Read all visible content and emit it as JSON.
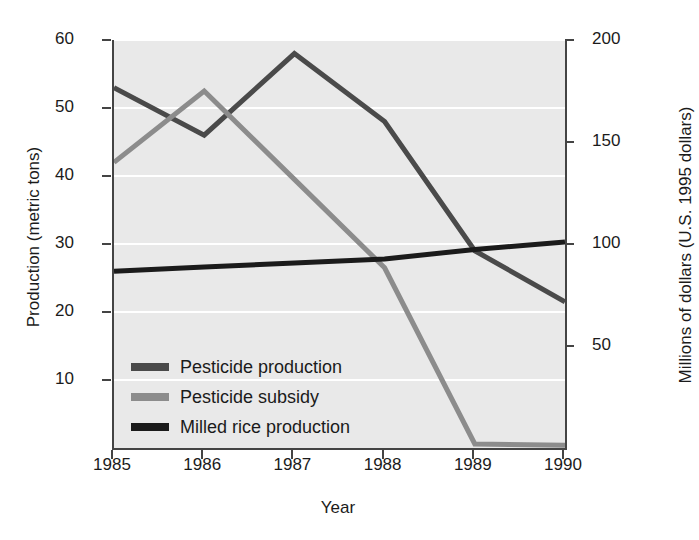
{
  "chart_data": {
    "type": "line",
    "title": "",
    "xlabel": "Year",
    "ylabel": "Production (metric tons)",
    "ylabel_right": "Millions of dollars (U.S. 1995 dollars)",
    "x": [
      1985,
      1986,
      1987,
      1988,
      1989,
      1990
    ],
    "categories": [
      "1985",
      "1986",
      "1987",
      "1988",
      "1989",
      "1990"
    ],
    "xlim": [
      1985,
      1990
    ],
    "ylim_left": [
      0,
      60
    ],
    "ylim_right": [
      0,
      200
    ],
    "yticks_left": [
      10,
      20,
      30,
      40,
      50,
      60
    ],
    "yticks_left_labels": [
      "10",
      "20",
      "30",
      "40",
      "50",
      "60"
    ],
    "yticks_right": [
      50,
      100,
      150,
      200
    ],
    "yticks_right_labels": [
      "50",
      "100",
      "150",
      "200"
    ],
    "grid": true,
    "grid_color": "#ffffff",
    "legend_position": "lower-left-inside",
    "plot_background": "#e9e9e9",
    "series": [
      {
        "name": "Pesticide production",
        "axis": "left",
        "color": "#4a4a4a",
        "values": [
          53.0,
          46.0,
          58.0,
          48.0,
          29.0,
          21.5
        ]
      },
      {
        "name": "Pesticide subsidy",
        "axis": "left",
        "color": "#8c8c8c",
        "values": [
          42.0,
          52.5,
          39.5,
          26.5,
          0.6,
          0.4
        ]
      },
      {
        "name": "Milled rice production",
        "axis": "left",
        "color": "#1b1b1b",
        "values": [
          26.0,
          26.6,
          27.2,
          27.8,
          29.2,
          30.3
        ]
      }
    ]
  },
  "legend": {
    "items": [
      {
        "label": "Pesticide production",
        "color": "#4a4a4a"
      },
      {
        "label": "Pesticide subsidy",
        "color": "#8c8c8c"
      },
      {
        "label": "Milled rice production",
        "color": "#1b1b1b"
      }
    ]
  }
}
